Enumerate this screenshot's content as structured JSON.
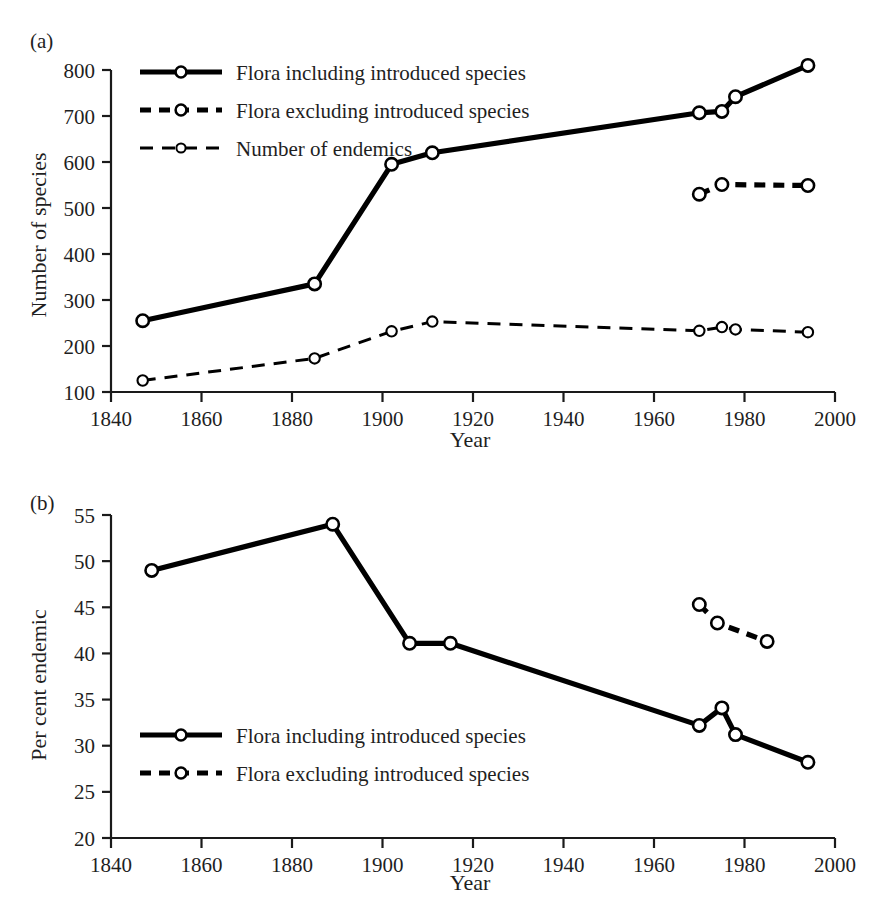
{
  "figure": {
    "background_color": "#ffffff",
    "line_color": "#000000",
    "marker_fill": "#ffffff"
  },
  "panels": [
    {
      "label": "(a)"
    },
    {
      "label": "(b)"
    }
  ],
  "chart_data": [
    {
      "type": "line",
      "panel": "(a)",
      "title": "",
      "xlabel": "Year",
      "ylabel": "Number of species",
      "xlim": [
        1840,
        2000
      ],
      "ylim": [
        100,
        800
      ],
      "xticks": [
        1840,
        1860,
        1880,
        1900,
        1920,
        1940,
        1960,
        1980,
        2000
      ],
      "yticks": [
        100,
        200,
        300,
        400,
        500,
        600,
        700,
        800
      ],
      "xtick_labels": [
        "1840",
        "1860",
        "1880",
        "1900",
        "1920",
        "1940",
        "1960",
        "1980",
        "2000"
      ],
      "ytick_labels": [
        "100",
        "200",
        "300",
        "400",
        "500",
        "600",
        "700",
        "800"
      ],
      "grid": false,
      "legend_position": "upper-left",
      "series": [
        {
          "name": "Flora including introduced species",
          "style": "solid-thick",
          "marker": "open-circle",
          "x": [
            1847,
            1885,
            1902,
            1911,
            1970,
            1975,
            1978,
            1994
          ],
          "y": [
            255,
            335,
            595,
            620,
            707,
            710,
            742,
            810
          ]
        },
        {
          "name": "Flora excluding introduced species",
          "style": "dashed-thick",
          "marker": "open-circle",
          "x": [
            1970,
            1975,
            1994
          ],
          "y": [
            530,
            551,
            549
          ]
        },
        {
          "name": "Number of endemics",
          "style": "dashed-thin",
          "marker": "open-circle",
          "x": [
            1847,
            1885,
            1902,
            1911,
            1970,
            1975,
            1978,
            1994
          ],
          "y": [
            125,
            173,
            232,
            253,
            233,
            241,
            236,
            230
          ]
        }
      ]
    },
    {
      "type": "line",
      "panel": "(b)",
      "title": "",
      "xlabel": "Year",
      "ylabel": "Per cent endemic",
      "xlim": [
        1840,
        2000
      ],
      "ylim": [
        20,
        55
      ],
      "xticks": [
        1840,
        1860,
        1880,
        1900,
        1920,
        1940,
        1960,
        1980,
        2000
      ],
      "yticks": [
        20,
        25,
        30,
        35,
        40,
        45,
        50,
        55
      ],
      "xtick_labels": [
        "1840",
        "1860",
        "1880",
        "1900",
        "1920",
        "1940",
        "1960",
        "1980",
        "2000"
      ],
      "ytick_labels": [
        "20",
        "25",
        "30",
        "35",
        "40",
        "45",
        "50",
        "55"
      ],
      "grid": false,
      "legend_position": "lower-left",
      "series": [
        {
          "name": "Flora including introduced species",
          "style": "solid-thick",
          "marker": "open-circle",
          "x": [
            1849,
            1889,
            1906,
            1915,
            1970,
            1975,
            1978,
            1994
          ],
          "y": [
            49.0,
            54.0,
            41.1,
            41.1,
            32.2,
            34.1,
            31.2,
            28.2
          ]
        },
        {
          "name": "Flora excluding introduced species",
          "style": "dashed-thick",
          "marker": "open-circle",
          "x": [
            1970,
            1974,
            1985
          ],
          "y": [
            45.3,
            43.3,
            41.3
          ]
        }
      ]
    }
  ],
  "legends": {
    "panel_a": [
      {
        "label": "Flora including introduced species",
        "style": "solid-thick"
      },
      {
        "label": "Flora excluding introduced species",
        "style": "dashed-thick"
      },
      {
        "label": "Number of endemics",
        "style": "dashed-thin"
      }
    ],
    "panel_b": [
      {
        "label": "Flora including introduced species",
        "style": "solid-thick"
      },
      {
        "label": "Flora excluding introduced species",
        "style": "dashed-thick"
      }
    ]
  }
}
